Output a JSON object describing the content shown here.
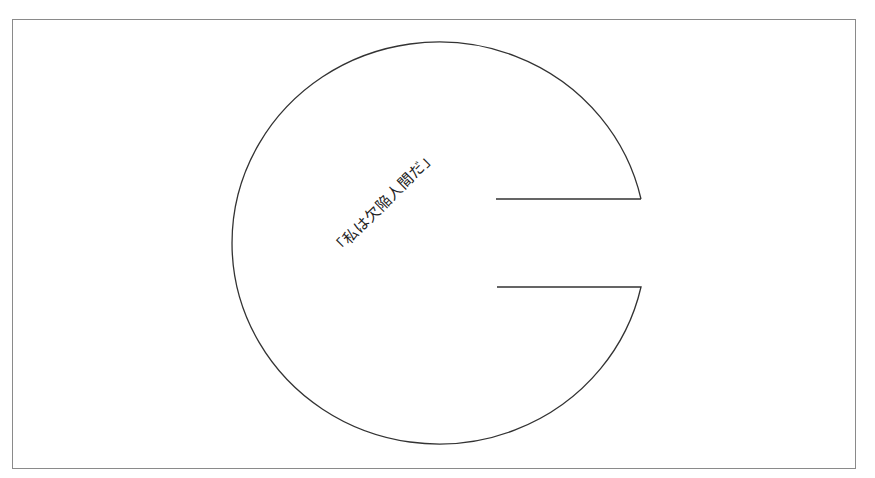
{
  "diagram": {
    "label": "「私は欠陥人間だ」",
    "shape": "circle-with-notch",
    "stroke_color": "#333333",
    "frame_color": "#8a8a8a"
  }
}
